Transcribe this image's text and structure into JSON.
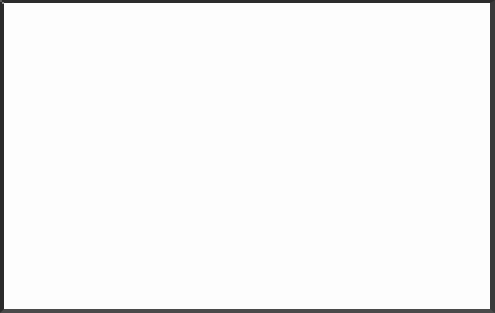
{
  "chart_data": {
    "type": "area",
    "xlabel": "Year",
    "ylabel": "",
    "categories": [
      "75",
      "76",
      "77",
      "78",
      "79",
      "80",
      "81",
      "82",
      "83",
      "84",
      "85",
      "86"
    ],
    "x": [
      75,
      76,
      77,
      78,
      79,
      80,
      81,
      82,
      83,
      84,
      85,
      86
    ],
    "ylim": [
      0,
      200
    ],
    "yticks": [
      0,
      100,
      200
    ],
    "yticklabels": [
      "0",
      "100",
      "200"
    ],
    "yminorticks": [
      50,
      150
    ],
    "grid": false,
    "stacked": true,
    "legend_position": "top-right",
    "series": [
      {
        "name": "Under 23",
        "color": "#0b0b0b",
        "values": [
          38,
          52,
          42,
          46,
          48,
          60,
          36,
          30,
          20,
          30,
          36,
          46
        ]
      },
      {
        "name": "23-35",
        "color": "#4f4f4f",
        "values": [
          45,
          55,
          46,
          50,
          53,
          67,
          34,
          35,
          36,
          45,
          47,
          43
        ]
      },
      {
        "name": "35-50",
        "color": "#6e6e6e",
        "values": [
          22,
          22,
          23,
          25,
          26,
          22,
          44,
          44,
          42,
          38,
          31,
          30
        ]
      },
      {
        "name": "50-60",
        "color": "#9b9b9b",
        "values": [
          10,
          9,
          8,
          8,
          8,
          7,
          9,
          9,
          8,
          12,
          11,
          12
        ]
      },
      {
        "name": "Over 60",
        "color": "#f2f2f2",
        "values": [
          7,
          8,
          6,
          10,
          9,
          9,
          10,
          9,
          7,
          6,
          6,
          7
        ]
      }
    ],
    "stack_totals": [
      122,
      146,
      125,
      139,
      144,
      165,
      133,
      127,
      113,
      131,
      131,
      138
    ]
  },
  "legend": {
    "items": [
      {
        "label": "Over 60",
        "color": "#a0a0a0"
      },
      {
        "label": "50-60",
        "color": "#9a9a9a"
      },
      {
        "label": "35-50",
        "color": "#6f6f6f"
      },
      {
        "label": "23-35",
        "color": "#4a4a4a"
      },
      {
        "label": "Under 23",
        "color": "#101010"
      }
    ]
  },
  "axes": {
    "y_labels": [
      "200",
      "100",
      "0"
    ],
    "x_labels": [
      "75",
      "76",
      "77",
      "78",
      "79",
      "80",
      "81",
      "82",
      "83",
      "84",
      "85",
      "86"
    ],
    "x_title": "Year"
  },
  "colors": {
    "frame": "#2b2b2b",
    "background": "#ffffff",
    "text": "#2b2b2b"
  }
}
